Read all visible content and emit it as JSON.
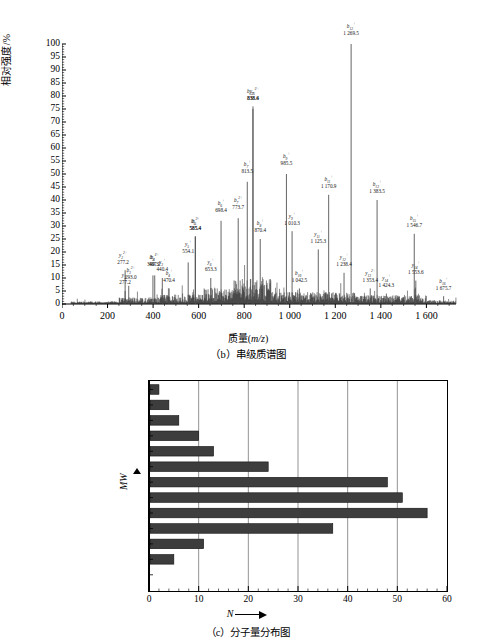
{
  "figure": {
    "panel_b": {
      "caption": "（b）串级质谱图",
      "ylabel": "相对强度/%",
      "xlabel_prefix": "质量(",
      "xlabel_italic": "m/z",
      "xlabel_suffix": ")"
    },
    "panel_c": {
      "caption": "（c）分子量分布图",
      "ylabel": "MW",
      "xlabel": "N"
    }
  },
  "chart_data": [
    {
      "type": "line",
      "id": "tandem-mass-spectrum",
      "title": "（b）串级质谱图",
      "xlabel": "质量(m/z)",
      "ylabel": "相对强度/%",
      "xlim": [
        0,
        1730
      ],
      "ylim": [
        0,
        100
      ],
      "grid": false,
      "xticks": [
        "0",
        "200",
        "400",
        "600",
        "800",
        "1 000",
        "1 200",
        "1 400",
        "1 600"
      ],
      "xtick_values": [
        0,
        200,
        400,
        600,
        800,
        1000,
        1200,
        1400,
        1600
      ],
      "yticks": [
        "0",
        "5",
        "10",
        "15",
        "20",
        "25",
        "30",
        "35",
        "40",
        "45",
        "50",
        "55",
        "60",
        "65",
        "70",
        "75",
        "80",
        "85",
        "90",
        "95",
        "100"
      ],
      "ytick_values": [
        0,
        5,
        10,
        15,
        20,
        25,
        30,
        35,
        40,
        45,
        50,
        55,
        60,
        65,
        70,
        75,
        80,
        85,
        90,
        95,
        100
      ],
      "annotated_peaks": [
        {
          "ion": "y",
          "idx": "2",
          "charge": "+",
          "mz": 277.2,
          "intensity": 5,
          "label_y": 9,
          "label_dx": 0
        },
        {
          "ion": "y",
          "idx": "2",
          "charge": "2+",
          "mz": 277.2,
          "intensity": 13,
          "label_y": 17,
          "label_dx": -2
        },
        {
          "ion": "b",
          "idx": "3",
          "charge": "2+",
          "mz": 293.0,
          "intensity": 7,
          "label_y": 11,
          "label_dx": 2
        },
        {
          "ion": "b",
          "idx": "3",
          "charge": "+",
          "mz": 399.3,
          "intensity": 11,
          "label_y": 16,
          "label_dx": 0
        },
        {
          "ion": "b",
          "idx": "4",
          "charge": "2+",
          "mz": 407.2,
          "intensity": 11,
          "label_y": 16,
          "label_dx": 0
        },
        {
          "ion": "y",
          "idx": "3",
          "charge": "+",
          "mz": 440.4,
          "intensity": 10,
          "label_y": 14,
          "label_dx": 0
        },
        {
          "ion": "b",
          "idx": "4",
          "charge": "+",
          "mz": 470.4,
          "intensity": 6,
          "label_y": 10,
          "label_dx": 0
        },
        {
          "ion": "y",
          "idx": "5",
          "charge": "+",
          "mz": 554.1,
          "intensity": 16,
          "label_y": 21,
          "label_dx": 0
        },
        {
          "ion": "b",
          "idx": "5",
          "charge": "2+",
          "mz": 585.4,
          "intensity": 26,
          "label_y": 30,
          "label_dx": 0
        },
        {
          "ion": "b",
          "idx": "5",
          "charge": "+",
          "mz": 585.4,
          "intensity": 26,
          "label_y": 30,
          "label_dx": 0
        },
        {
          "ion": "y",
          "idx": "6",
          "charge": "+",
          "mz": 653.3,
          "intensity": 10,
          "label_y": 14,
          "label_dx": 0
        },
        {
          "ion": "b",
          "idx": "6",
          "charge": "+",
          "mz": 698.4,
          "intensity": 32,
          "label_y": 37,
          "label_dx": 0
        },
        {
          "ion": "b",
          "idx": "7",
          "charge": "2+",
          "mz": 773.7,
          "intensity": 33,
          "label_y": 38,
          "label_dx": 0
        },
        {
          "ion": "b",
          "idx": "7",
          "charge": "+",
          "mz": 813.5,
          "intensity": 47,
          "label_y": 52,
          "label_dx": 0
        },
        {
          "ion": "y",
          "idx": "7",
          "charge": "+",
          "mz": 838.4,
          "intensity": 75,
          "label_y": 80,
          "label_dx": 0
        },
        {
          "ion": "b",
          "idx": "225",
          "charge": "2+",
          "mz": 838.6,
          "intensity": 76,
          "label_y": 80,
          "label_dx": 0
        },
        {
          "ion": "b",
          "idx": "8",
          "charge": "+",
          "mz": 870.4,
          "intensity": 25,
          "label_y": 29,
          "label_dx": 0
        },
        {
          "ion": "b",
          "idx": "9",
          "charge": "+",
          "mz": 985.5,
          "intensity": 50,
          "label_y": 55,
          "label_dx": 0
        },
        {
          "ion": "y",
          "idx": "9",
          "charge": "+",
          "mz": 1010.3,
          "intensity": 28,
          "label_y": 32,
          "label_dx": 0
        },
        {
          "ion": "b",
          "idx": "10",
          "charge": "+",
          "mz": 1042.5,
          "intensity": 6,
          "label_y": 10,
          "label_dx": 0
        },
        {
          "ion": "y",
          "idx": "11",
          "charge": "+",
          "mz": 1125.3,
          "intensity": 21,
          "label_y": 25,
          "label_dx": 0
        },
        {
          "ion": "b",
          "idx": "11",
          "charge": "+",
          "mz": 1170.9,
          "intensity": 42,
          "label_y": 46,
          "label_dx": 0
        },
        {
          "ion": "y",
          "idx": "12",
          "charge": "+",
          "mz": 1238.4,
          "intensity": 12,
          "label_y": 16,
          "label_dx": 0
        },
        {
          "ion": "b",
          "idx": "12",
          "charge": "+",
          "mz": 1269.5,
          "intensity": 100,
          "label_y": 105,
          "label_dx": 0
        },
        {
          "ion": "y",
          "idx": "13",
          "charge": "2+",
          "mz": 1353.4,
          "intensity": 6,
          "label_y": 10,
          "label_dx": 0
        },
        {
          "ion": "b",
          "idx": "13",
          "charge": "+",
          "mz": 1383.5,
          "intensity": 40,
          "label_y": 44,
          "label_dx": 0
        },
        {
          "ion": "y",
          "idx": "14",
          "charge": "+",
          "mz": 1424.3,
          "intensity": 4,
          "label_y": 8,
          "label_dx": 0
        },
        {
          "ion": "b",
          "idx": "15",
          "charge": "+",
          "mz": 1546.7,
          "intensity": 27,
          "label_y": 31,
          "label_dx": 0
        },
        {
          "ion": "y",
          "idx": "14",
          "charge": "+",
          "mz": 1553.6,
          "intensity": 9,
          "label_y": 13,
          "label_dx": 0
        },
        {
          "ion": "b",
          "idx": "16",
          "charge": "+",
          "mz": 1675.7,
          "intensity": 3,
          "label_y": 7,
          "label_dx": 0
        }
      ]
    },
    {
      "type": "bar",
      "orientation": "horizontal",
      "id": "molecular-weight-distribution",
      "title": "（c）分子量分布图",
      "xlabel": "N",
      "ylabel": "MW",
      "xlim": [
        0,
        60
      ],
      "grid": true,
      "xticks": [
        "0",
        "10",
        "20",
        "30",
        "40",
        "50",
        "60"
      ],
      "xtick_values": [
        0,
        10,
        20,
        30,
        40,
        50,
        60
      ],
      "categories": [
        "3 000～3 200",
        "2 800～3 000",
        "2 600～2 800",
        "2 400～2 600",
        "2 200～2 400",
        "2 000～2 200",
        "1 800～2 000",
        "1 600～1 800",
        "1 400～1 600",
        "1 200～1 400",
        "1 000～1 200",
        "800～1 000",
        "600～800"
      ],
      "values": [
        2,
        4,
        6,
        10,
        13,
        24,
        48,
        51,
        56,
        37,
        11,
        5,
        0
      ],
      "bar_color": "#3d3d3d"
    }
  ]
}
